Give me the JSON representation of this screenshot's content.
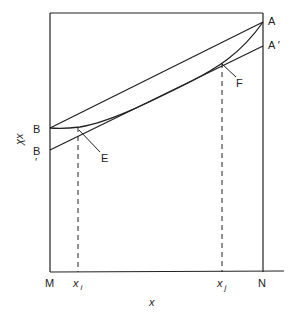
{
  "diagram": {
    "axis_labels": {
      "y": "χx",
      "x": "x"
    },
    "points": {
      "A": "A",
      "A_prime": "A ′",
      "B": "B",
      "B_prime": "B",
      "B_prime_mark": "′",
      "E": "E",
      "F": "F",
      "M": "M",
      "N": "N"
    },
    "ticks": {
      "xi_base": "x",
      "xi_sub": "i",
      "xj_base": "x",
      "xj_sub": "j"
    },
    "colors": {
      "line": "#222222",
      "background": "#ffffff"
    }
  }
}
